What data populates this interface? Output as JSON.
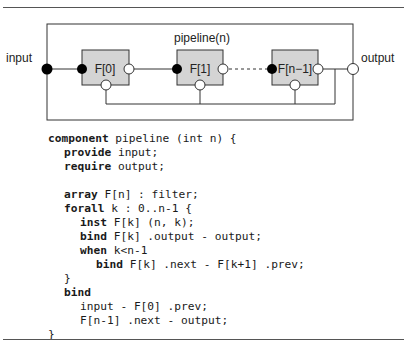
{
  "diagram": {
    "container_label": "pipeline(n)",
    "input_label": "input",
    "output_label": "output",
    "filters": [
      {
        "label": "F[0]"
      },
      {
        "label": "F[1]"
      },
      {
        "label": "F[n−1]"
      }
    ],
    "colors": {
      "filter_fill": "#d4d4d4",
      "stroke": "#333333",
      "port_filled": "#000000",
      "port_open": "#ffffff"
    }
  },
  "code": {
    "lines": [
      {
        "indent": 0,
        "kw": "component",
        "rest": " pipeline (int n) {"
      },
      {
        "indent": 1,
        "kw": "provide",
        "rest": " input;"
      },
      {
        "indent": 1,
        "kw": "require",
        "rest": " output;"
      },
      {
        "indent": 0,
        "kw": "",
        "rest": ""
      },
      {
        "indent": 1,
        "kw": "array",
        "rest": " F[n] : filter;"
      },
      {
        "indent": 1,
        "kw": "forall",
        "rest": " k : 0..n-1 {"
      },
      {
        "indent": 2,
        "kw": "inst",
        "rest": " F[k] (n, k);"
      },
      {
        "indent": 2,
        "kw": "bind",
        "rest": " F[k] .output - output;"
      },
      {
        "indent": 2,
        "kw": "when",
        "rest": " k<n-1"
      },
      {
        "indent": 3,
        "kw": "bind",
        "rest": " F[k] .next - F[k+1] .prev;"
      },
      {
        "indent": 1,
        "kw": "",
        "rest": "}"
      },
      {
        "indent": 1,
        "kw": "bind",
        "rest": ""
      },
      {
        "indent": 2,
        "kw": "",
        "rest": "input - F[0] .prev;"
      },
      {
        "indent": 2,
        "kw": "",
        "rest": "F[n-1] .next - output;"
      },
      {
        "indent": 0,
        "kw": "",
        "rest": "}"
      }
    ]
  }
}
